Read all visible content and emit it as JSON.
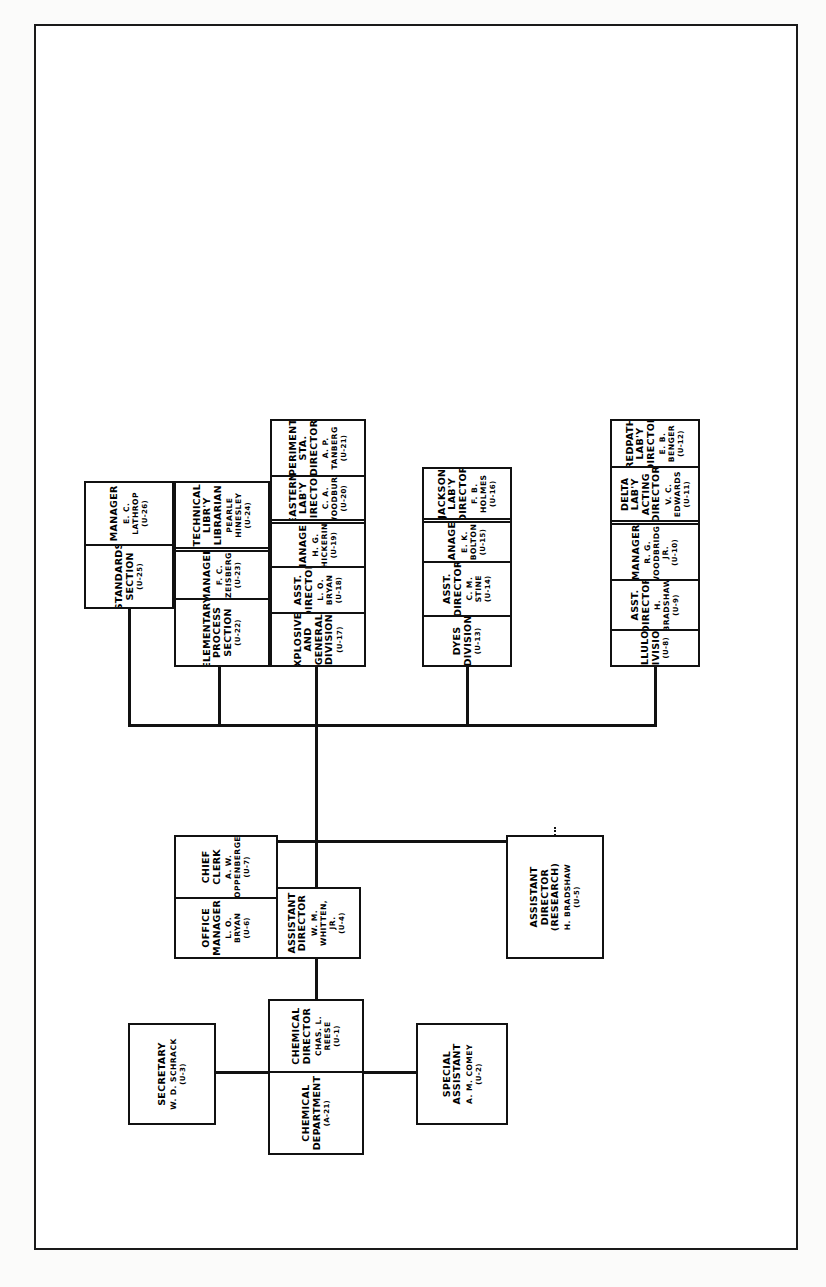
{
  "document": {
    "kind": "organization-chart",
    "orientation": "rotated-90-ccw"
  },
  "nodes": {
    "chemical_department": {
      "title": "CHEMICAL DEPARTMENT",
      "name": "",
      "code": "(A-21)"
    },
    "chemical_director": {
      "title": "CHEMICAL DIRECTOR",
      "name": "CHAS. L. REESE",
      "code": "(U-1)"
    },
    "secretary": {
      "title": "SECRETARY",
      "name": "W. D. SCHRACK",
      "code": "(U-3)"
    },
    "special_assistant": {
      "title": "SPECIAL ASSISTANT",
      "name": "A. M. COMEY",
      "code": "(U-2)"
    },
    "assistant_director": {
      "title": "ASSISTANT DIRECTOR",
      "name": "W. M. WHITTEN, JR.",
      "code": "(U-4)"
    },
    "assistant_director_research": {
      "title": "ASSISTANT DIRECTOR\n(RESEARCH)",
      "name": "H. BRADSHAW",
      "code": "(U-5)"
    },
    "office_manager": {
      "title": "OFFICE MANAGER",
      "name": "L. O. BRYAN",
      "code": "(U-6)"
    },
    "chief_clerk": {
      "title": "CHIEF CLERK",
      "name": "A. W. KOPPENBERGER",
      "code": "(U-7)"
    },
    "cellulose_division": {
      "title": "CELLULOSE\nDIVISION",
      "name": "",
      "code": "(U-8)"
    },
    "cellulose_asst_dir": {
      "title": "ASST. DIRECTOR",
      "name": "H. BRADSHAW",
      "code": "(U-9)"
    },
    "cellulose_manager": {
      "title": "MANAGER",
      "name": "R. G. WOODBRIDGE JR.",
      "code": "(U-10)"
    },
    "delta_lab": {
      "title": "DELTA LAB'Y\nACTING DIRECTOR",
      "name": "V. C. EDWARDS",
      "code": "(U-11)"
    },
    "redpath_lab": {
      "title": "REDPATH LAB'Y\nDIRECTOR",
      "name": "E. B. BENGER",
      "code": "(U-12)"
    },
    "dyes_division": {
      "title": "DYES DIVISION",
      "name": "",
      "code": "(U-13)"
    },
    "dyes_asst_dir": {
      "title": "ASST. DIRECTOR",
      "name": "C. M. STINE",
      "code": "(U-14)"
    },
    "dyes_manager": {
      "title": "MANAGER",
      "name": "E. K. BOLTON",
      "code": "(U-15)"
    },
    "jackson_lab": {
      "title": "JACKSON LAB'Y\nDIRECTOR",
      "name": "F. B. HOLMES",
      "code": "(U-16)"
    },
    "explosives_division": {
      "title": "EXPLOSIVES AND\nGENERAL DIVISION",
      "name": "",
      "code": "(U-17)"
    },
    "explosives_asst_dir": {
      "title": "ASST. DIRECTOR",
      "name": "L. O. BRYAN",
      "code": "(U-18)"
    },
    "explosives_manager": {
      "title": "MANAGER",
      "name": "H. G. CHICKERING",
      "code": "(U-19)"
    },
    "eastern_lab": {
      "title": "EASTERN LAB'Y\nDIRECTOR",
      "name": "C. A. WOODBURY",
      "code": "(U-20)"
    },
    "experimental_sta": {
      "title": "EXPERIMENTAL STA.\nDIRECTOR",
      "name": "A. P. TANBERG",
      "code": "(U-21)"
    },
    "elementary_process": {
      "title": "ELEMENTARY\nPROCESS SECTION",
      "name": "",
      "code": "(U-22)"
    },
    "elementary_manager": {
      "title": "MANAGER",
      "name": "F. C. ZEISBERG",
      "code": "(U-23)"
    },
    "technical_library": {
      "title": "TECHNICAL LIBR'Y\nLIBRARIAN",
      "name": "PEARLE HINESLEY",
      "code": "(U-24)"
    },
    "standards_section": {
      "title": "STANDARDS\nSECTION",
      "name": "",
      "code": "(U-25)"
    },
    "standards_manager": {
      "title": "MANAGER",
      "name": "E. C. LATHROP",
      "code": "(U-26)"
    }
  },
  "style": {
    "line_color": "#111111",
    "box_border_color": "#111111",
    "background": "#ffffff",
    "text_color": "#000000"
  }
}
